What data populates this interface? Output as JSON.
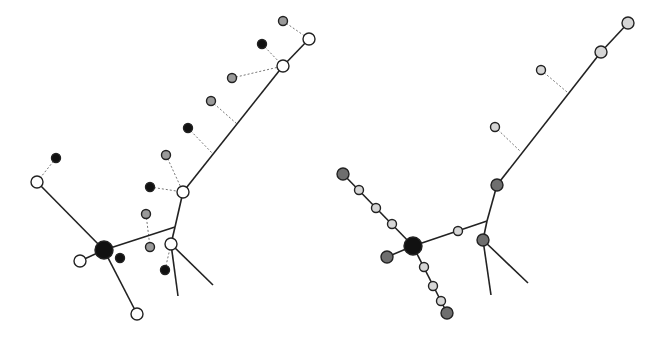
{
  "colors": {
    "white": "#ffffff",
    "black": "#111111",
    "gray": "#9a9a9a",
    "dark_gray": "#6e6e6e",
    "light_gray": "#d6d6d6",
    "edge": "#222222",
    "dotted": "#777777"
  },
  "diagrams": [
    {
      "id": "left-tree",
      "edges": [
        [
          37,
          182,
          104,
          250
        ],
        [
          104,
          250,
          80,
          261
        ],
        [
          104,
          250,
          137,
          314
        ],
        [
          104,
          250,
          175,
          227
        ],
        [
          175,
          227,
          183,
          192
        ],
        [
          183,
          192,
          283,
          66
        ],
        [
          283,
          66,
          309,
          39
        ],
        [
          175,
          227,
          171,
          244
        ],
        [
          171,
          244,
          178,
          296
        ],
        [
          171,
          244,
          213,
          285
        ]
      ],
      "dotted_edges": [
        [
          56,
          158,
          37,
          182
        ],
        [
          283,
          21,
          309,
          39
        ],
        [
          262,
          44,
          283,
          66
        ],
        [
          232,
          78,
          283,
          66
        ],
        [
          211,
          101,
          237,
          124
        ],
        [
          188,
          128,
          213,
          154
        ],
        [
          166,
          155,
          183,
          192
        ],
        [
          150,
          187,
          183,
          192
        ],
        [
          146,
          214,
          150,
          247
        ],
        [
          165,
          270,
          171,
          244
        ]
      ],
      "nodes": [
        {
          "x": 104,
          "y": 250,
          "r": 9,
          "fill": "black"
        },
        {
          "x": 37,
          "y": 182,
          "r": 6,
          "fill": "white"
        },
        {
          "x": 80,
          "y": 261,
          "r": 6,
          "fill": "white"
        },
        {
          "x": 137,
          "y": 314,
          "r": 6,
          "fill": "white"
        },
        {
          "x": 183,
          "y": 192,
          "r": 6,
          "fill": "white"
        },
        {
          "x": 283,
          "y": 66,
          "r": 6,
          "fill": "white"
        },
        {
          "x": 309,
          "y": 39,
          "r": 6,
          "fill": "white"
        },
        {
          "x": 171,
          "y": 244,
          "r": 6,
          "fill": "white"
        },
        {
          "x": 56,
          "y": 158,
          "r": 4.5,
          "fill": "black"
        },
        {
          "x": 120,
          "y": 258,
          "r": 4.5,
          "fill": "black"
        },
        {
          "x": 283,
          "y": 21,
          "r": 4.5,
          "fill": "gray"
        },
        {
          "x": 262,
          "y": 44,
          "r": 4.5,
          "fill": "black"
        },
        {
          "x": 232,
          "y": 78,
          "r": 4.5,
          "fill": "gray"
        },
        {
          "x": 211,
          "y": 101,
          "r": 4.5,
          "fill": "gray"
        },
        {
          "x": 188,
          "y": 128,
          "r": 4.5,
          "fill": "black"
        },
        {
          "x": 166,
          "y": 155,
          "r": 4.5,
          "fill": "gray"
        },
        {
          "x": 150,
          "y": 187,
          "r": 4.5,
          "fill": "black"
        },
        {
          "x": 146,
          "y": 214,
          "r": 4.5,
          "fill": "gray"
        },
        {
          "x": 150,
          "y": 247,
          "r": 4.5,
          "fill": "gray"
        },
        {
          "x": 165,
          "y": 270,
          "r": 4.5,
          "fill": "black"
        }
      ]
    },
    {
      "id": "right-tree",
      "edges": [
        [
          343,
          174,
          413,
          246
        ],
        [
          413,
          246,
          387,
          257
        ],
        [
          413,
          246,
          447,
          313
        ],
        [
          413,
          246,
          487,
          221
        ],
        [
          487,
          221,
          497,
          185
        ],
        [
          497,
          185,
          601,
          52
        ],
        [
          601,
          52,
          628,
          23
        ],
        [
          487,
          221,
          483,
          240
        ],
        [
          483,
          240,
          491,
          295
        ],
        [
          483,
          240,
          528,
          283
        ]
      ],
      "dotted_edges": [
        [
          541,
          70,
          567,
          92
        ],
        [
          495,
          127,
          520,
          151
        ]
      ],
      "nodes": [
        {
          "x": 413,
          "y": 246,
          "r": 9,
          "fill": "black"
        },
        {
          "x": 343,
          "y": 174,
          "r": 6,
          "fill": "dark_gray"
        },
        {
          "x": 359,
          "y": 190,
          "r": 4.5,
          "fill": "light_gray"
        },
        {
          "x": 376,
          "y": 208,
          "r": 4.5,
          "fill": "light_gray"
        },
        {
          "x": 392,
          "y": 224,
          "r": 4.5,
          "fill": "light_gray"
        },
        {
          "x": 387,
          "y": 257,
          "r": 6,
          "fill": "dark_gray"
        },
        {
          "x": 424,
          "y": 267,
          "r": 4.5,
          "fill": "light_gray"
        },
        {
          "x": 433,
          "y": 286,
          "r": 4.5,
          "fill": "light_gray"
        },
        {
          "x": 441,
          "y": 301,
          "r": 4.5,
          "fill": "light_gray"
        },
        {
          "x": 447,
          "y": 313,
          "r": 6,
          "fill": "dark_gray"
        },
        {
          "x": 458,
          "y": 231,
          "r": 4.5,
          "fill": "light_gray"
        },
        {
          "x": 497,
          "y": 185,
          "r": 6,
          "fill": "dark_gray"
        },
        {
          "x": 483,
          "y": 240,
          "r": 6,
          "fill": "dark_gray"
        },
        {
          "x": 601,
          "y": 52,
          "r": 6,
          "fill": "light_gray"
        },
        {
          "x": 628,
          "y": 23,
          "r": 6,
          "fill": "light_gray"
        },
        {
          "x": 541,
          "y": 70,
          "r": 4.5,
          "fill": "light_gray"
        },
        {
          "x": 495,
          "y": 127,
          "r": 4.5,
          "fill": "light_gray"
        }
      ]
    }
  ]
}
